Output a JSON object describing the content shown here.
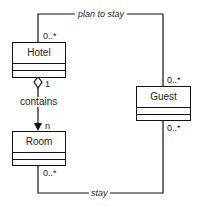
{
  "classes": {
    "hotel": {
      "name": "Hotel"
    },
    "guest": {
      "name": "Guest"
    },
    "room": {
      "name": "Room"
    }
  },
  "associations": {
    "plan_to_stay": {
      "label": "plan to stay",
      "hotel_mult": "0..*",
      "guest_mult": "0..*"
    },
    "contains": {
      "label": "contains",
      "hotel_mult": "1",
      "room_mult": "n"
    },
    "stay": {
      "label": "stay",
      "room_mult": "0..*",
      "guest_mult": "0..*"
    }
  }
}
